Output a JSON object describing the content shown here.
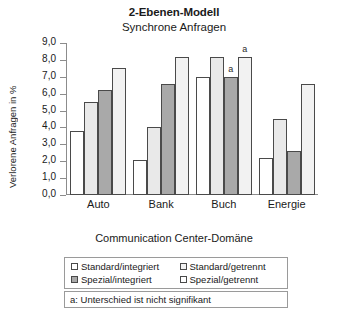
{
  "chart_data": {
    "type": "bar",
    "title": "2-Ebenen-Modell",
    "subtitle": "Synchrone Anfragen",
    "xlabel": "Communication Center-Domäne",
    "ylabel": "Verlorene Anfragen in %",
    "categories": [
      "Auto",
      "Bank",
      "Buch",
      "Energie"
    ],
    "ylim": [
      0,
      9
    ],
    "ytick_labels": [
      "0,0",
      "1,0",
      "2,0",
      "3,0",
      "4,0",
      "5,0",
      "6,0",
      "7,0",
      "8,0",
      "9,0"
    ],
    "ytick_values": [
      0,
      1,
      2,
      3,
      4,
      5,
      6,
      7,
      8,
      9
    ],
    "grid": false,
    "legend_position": "below-axes",
    "series": [
      {
        "name": "Standard/integriert",
        "color": "#ffffff",
        "values": [
          3.8,
          2.1,
          7.0,
          2.2
        ],
        "annotations": [
          "",
          "",
          "",
          ""
        ]
      },
      {
        "name": "Spezial/integriert",
        "color": "#e9e9e9",
        "values": [
          5.5,
          4.0,
          8.2,
          4.5
        ],
        "annotations": [
          "",
          "",
          "",
          ""
        ]
      },
      {
        "name": "Standard/getrennt",
        "color": "#a9a9a9",
        "values": [
          6.2,
          6.6,
          7.0,
          2.6
        ],
        "annotations": [
          "",
          "",
          "a",
          ""
        ]
      },
      {
        "name": "Spezial/getrennt",
        "color": "#f2f2f2",
        "values": [
          7.5,
          8.2,
          8.2,
          6.6
        ],
        "annotations": [
          "",
          "",
          "a",
          ""
        ]
      }
    ],
    "footnote": "a: Unterschied ist nicht signifikant",
    "legend_order": [
      "Standard/integriert",
      "Standard/getrennt",
      "Spezial/integriert",
      "Spezial/getrennt"
    ]
  },
  "legend": {
    "items": [
      {
        "label": "Standard/integriert",
        "color": "#ffffff"
      },
      {
        "label": "Standard/getrennt",
        "color": "#f2f2f2"
      },
      {
        "label": "Spezial/integriert",
        "color": "#a9a9a9"
      },
      {
        "label": "Spezial/getrennt",
        "color": "#ffffff"
      }
    ]
  },
  "footnote": {
    "text": "a: Unterschied ist nicht signifikant"
  }
}
